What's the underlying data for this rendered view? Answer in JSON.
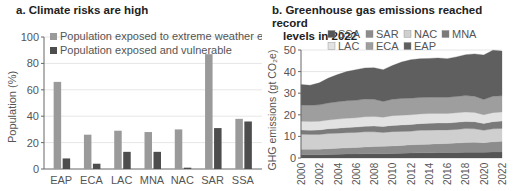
{
  "panels": {
    "a": {
      "title": "a. Climate risks are high"
    },
    "b": {
      "title_line1": "b.  Greenhouse gas emissions reached record",
      "title_line2": "levels in 2022"
    }
  },
  "chart_data": [
    {
      "type": "bar",
      "title": "a. Climate risks are high",
      "xlabel": "",
      "ylabel": "Population (%)",
      "ylim": [
        0,
        100
      ],
      "yticks": [
        0,
        20,
        40,
        60,
        80,
        100
      ],
      "grid": true,
      "legend_position": "top-left",
      "categories": [
        "EAP",
        "ECA",
        "LAC",
        "MNA",
        "NAC",
        "SAR",
        "SSA"
      ],
      "series": [
        {
          "name": "Population exposed to extreme weather event",
          "color": "#9a9a9a",
          "values": [
            66,
            26,
            29,
            28,
            30,
            87,
            38
          ]
        },
        {
          "name": "Population exposed and vulnerable",
          "color": "#4d4d4d",
          "values": [
            8,
            4,
            13,
            13,
            1,
            31,
            36
          ]
        }
      ]
    },
    {
      "type": "area",
      "stacked": true,
      "title": "b. Greenhouse gas emissions reached record levels in 2022",
      "xlabel": "",
      "ylabel": "GHG emissions (gt CO₂e)",
      "ylim": [
        0,
        50
      ],
      "yticks": [
        0,
        10,
        20,
        30,
        40,
        50
      ],
      "grid": true,
      "legend_position": "top",
      "x": [
        2000,
        2001,
        2002,
        2003,
        2004,
        2005,
        2006,
        2007,
        2008,
        2009,
        2010,
        2011,
        2012,
        2013,
        2014,
        2015,
        2016,
        2017,
        2018,
        2019,
        2020,
        2021,
        2022
      ],
      "xticks": [
        "2000",
        "2002",
        "2004",
        "2006",
        "2008",
        "2010",
        "2012",
        "2014",
        "2016",
        "2018",
        "2020",
        "2022"
      ],
      "legend_order": [
        "SSA",
        "SAR",
        "NAC",
        "MNA",
        "LAC",
        "ECA",
        "EAP"
      ],
      "series": [
        {
          "name": "SSA",
          "color": "#555555",
          "values": [
            1.5,
            1.5,
            1.5,
            1.6,
            1.7,
            1.8,
            1.9,
            2.0,
            2.0,
            2.0,
            2.1,
            2.2,
            2.3,
            2.4,
            2.4,
            2.5,
            2.5,
            2.6,
            2.7,
            2.7,
            2.7,
            2.8,
            2.8
          ]
        },
        {
          "name": "SAR",
          "color": "#8c8c8c",
          "values": [
            2.5,
            2.5,
            2.6,
            2.7,
            2.8,
            2.9,
            3.0,
            3.1,
            3.3,
            3.4,
            3.5,
            3.6,
            3.8,
            3.9,
            4.0,
            4.1,
            4.2,
            4.3,
            4.5,
            4.6,
            4.4,
            4.7,
            4.9
          ]
        },
        {
          "name": "NAC",
          "color": "#cfcfcf",
          "values": [
            7.0,
            6.9,
            6.8,
            7.0,
            7.0,
            7.0,
            6.9,
            7.0,
            6.8,
            6.4,
            6.6,
            6.5,
            6.3,
            6.5,
            6.5,
            6.4,
            6.3,
            6.3,
            6.4,
            6.2,
            5.7,
            6.0,
            6.0
          ]
        },
        {
          "name": "MNA",
          "color": "#7a7a7a",
          "values": [
            2.0,
            2.0,
            2.1,
            2.2,
            2.3,
            2.4,
            2.5,
            2.6,
            2.7,
            2.8,
            2.9,
            3.0,
            3.1,
            3.1,
            3.2,
            3.2,
            3.2,
            3.3,
            3.3,
            3.3,
            3.2,
            3.3,
            3.4
          ]
        },
        {
          "name": "LAC",
          "color": "#e2e2e2",
          "values": [
            4.0,
            4.0,
            4.0,
            4.1,
            4.2,
            4.3,
            4.3,
            4.4,
            4.4,
            4.3,
            4.5,
            4.5,
            4.5,
            4.5,
            4.5,
            4.4,
            4.4,
            4.4,
            4.4,
            4.3,
            4.0,
            4.2,
            4.2
          ]
        },
        {
          "name": "ECA",
          "color": "#9e9e9e",
          "values": [
            7.5,
            7.5,
            7.6,
            7.9,
            8.0,
            8.1,
            8.1,
            8.2,
            8.0,
            7.3,
            7.6,
            7.8,
            7.7,
            7.6,
            7.5,
            7.5,
            7.5,
            7.6,
            7.6,
            7.5,
            7.1,
            7.6,
            7.5
          ]
        },
        {
          "name": "EAP",
          "color": "#5f5f5f",
          "values": [
            9.5,
            9.3,
            10.2,
            11.5,
            12.6,
            13.5,
            14.2,
            14.4,
            14.6,
            14.7,
            15.6,
            16.8,
            17.8,
            18.0,
            18.0,
            18.2,
            17.9,
            18.3,
            18.9,
            19.6,
            20.6,
            21.3,
            20.7
          ]
        }
      ]
    }
  ]
}
